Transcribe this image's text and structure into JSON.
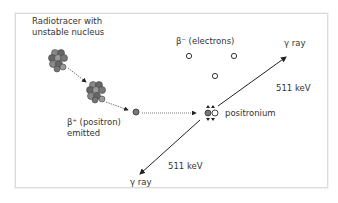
{
  "diagram": {
    "labels": {
      "radiotracer_line1": "Radiotracer with",
      "radiotracer_line2": "unstable nucleus",
      "electrons": "β⁻ (electrons)",
      "positron_line1": "β⁺ (positron)",
      "positron_line2": "emitted",
      "positronium": "positronium",
      "gamma_top": "γ ray",
      "energy_top": "511 keV",
      "gamma_bottom": "γ ray",
      "energy_bottom": "511 keV"
    },
    "colors": {
      "nucleon": "#7a7a7a",
      "nucleon_dark": "#555555",
      "positron": "#777777",
      "electron": "#ffffff",
      "line": "#333333",
      "frame": "#dcdcdc"
    }
  }
}
